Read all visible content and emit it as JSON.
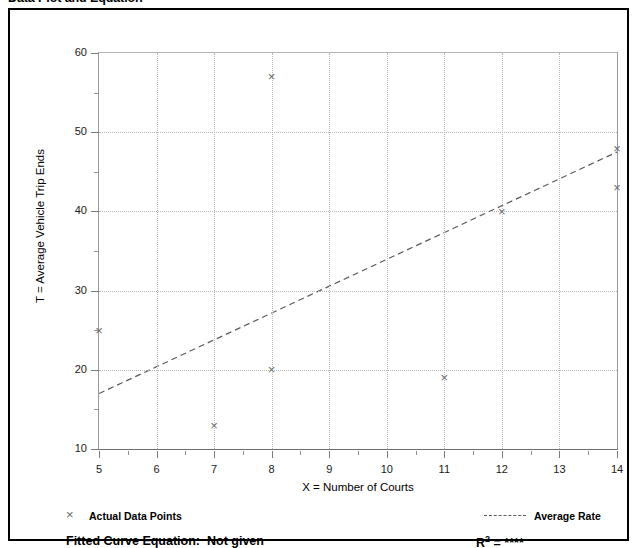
{
  "page": {
    "title": "Data Plot and Equation"
  },
  "legend": {
    "points_label": "Actual Data Points",
    "points_icon": "x-marker-icon",
    "line_label": "Average Rate",
    "line_icon": "dashed-line-icon"
  },
  "footer": {
    "fitted_curve_label": "Fitted Curve Equation:",
    "fitted_curve_value": "Not given",
    "r2_label": "R",
    "r2_sup": "2",
    "r2_eq": " = ",
    "r2_value": "****"
  },
  "chart_data": {
    "type": "scatter",
    "title": "Data Plot and Equation",
    "xlabel": "X = Number of Courts",
    "ylabel": "T = Average Vehicle Trip Ends",
    "xlim": [
      5,
      14
    ],
    "ylim": [
      10,
      60
    ],
    "xticks": [
      5,
      6,
      7,
      8,
      9,
      10,
      11,
      12,
      13,
      14
    ],
    "xtick_labels": [
      "5",
      "6",
      "7",
      "8",
      "9",
      "10",
      "11",
      "12",
      "13",
      "14"
    ],
    "yticks": [
      10,
      20,
      30,
      40,
      50,
      60
    ],
    "ytick_labels": [
      "10",
      "20",
      "30",
      "40",
      "50",
      "60"
    ],
    "yticks_minor": [
      15,
      25,
      35,
      45,
      55
    ],
    "grid": true,
    "grid_style": "dotted",
    "legend_position": "below-plot",
    "series": [
      {
        "name": "Actual Data Points",
        "type": "scatter",
        "marker": "x",
        "color": "#6b6b6b",
        "points": [
          {
            "x": 5,
            "y": 25
          },
          {
            "x": 7,
            "y": 13
          },
          {
            "x": 8,
            "y": 57
          },
          {
            "x": 8,
            "y": 20
          },
          {
            "x": 11,
            "y": 19
          },
          {
            "x": 12,
            "y": 40
          },
          {
            "x": 14,
            "y": 48
          },
          {
            "x": 14,
            "y": 43
          }
        ]
      },
      {
        "name": "Average Rate",
        "type": "line",
        "style": "dashed",
        "color": "#5a5a5a",
        "endpoints": [
          {
            "x": 5,
            "y": 17
          },
          {
            "x": 14,
            "y": 47.5
          }
        ]
      }
    ]
  }
}
